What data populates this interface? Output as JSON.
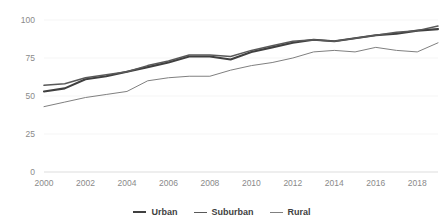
{
  "chart_data": {
    "type": "line",
    "title": "",
    "subtitle": "",
    "xlabel": "",
    "ylabel": "",
    "xlim": [
      2000,
      2019
    ],
    "ylim": [
      0,
      100
    ],
    "grid": true,
    "legend_position": "bottom",
    "x": [
      2000,
      2001,
      2002,
      2003,
      2004,
      2005,
      2006,
      2007,
      2008,
      2009,
      2010,
      2011,
      2012,
      2013,
      2014,
      2015,
      2016,
      2017,
      2018,
      2019
    ],
    "xticks": [
      "2000",
      "2002",
      "2004",
      "2006",
      "2008",
      "2010",
      "2012",
      "2014",
      "2016",
      "2018"
    ],
    "xtick_values": [
      2000,
      2002,
      2004,
      2006,
      2008,
      2010,
      2012,
      2014,
      2016,
      2018
    ],
    "yticks": [
      "0",
      "25",
      "50",
      "75",
      "100"
    ],
    "ytick_values": [
      0,
      25,
      50,
      75,
      100
    ],
    "series": [
      {
        "name": "Urban",
        "color": "#404040",
        "width": 2.1,
        "values": [
          53,
          55,
          61,
          63,
          66,
          69,
          72,
          76,
          76,
          74,
          79,
          82,
          85,
          87,
          86,
          88,
          90,
          91,
          93,
          94
        ]
      },
      {
        "name": "Suburban",
        "color": "#595959",
        "width": 1.5,
        "values": [
          57,
          58,
          62,
          64,
          66,
          70,
          73,
          77,
          77,
          76,
          80,
          83,
          86,
          87,
          86,
          88,
          90,
          92,
          93,
          96
        ]
      },
      {
        "name": "Rural",
        "color": "#808080",
        "width": 1.0,
        "values": [
          43,
          46,
          49,
          51,
          53,
          60,
          62,
          63,
          63,
          67,
          70,
          72,
          75,
          79,
          80,
          79,
          82,
          80,
          79,
          85
        ]
      }
    ]
  },
  "legend": {
    "items": [
      {
        "label": "Urban"
      },
      {
        "label": "Suburban"
      },
      {
        "label": "Rural"
      }
    ]
  }
}
